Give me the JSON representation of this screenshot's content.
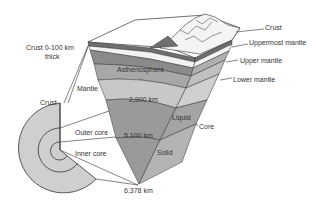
{
  "diagram": {
    "title": "",
    "colors": {
      "background": "#ffffff",
      "line": "#333333",
      "crust_dark": "#6e6e6e",
      "uppermost_mantle": "#f2f2f2",
      "asthenosphere": "#8a8a8a",
      "upper_mantle": "#a8a8a8",
      "lower_mantle": "#c8c8c8",
      "outer_core": "#9a9a9a",
      "inner_core": "#b4b4b4",
      "cross_section": "#cfcfcf",
      "mountain": "#f4f4f4"
    },
    "right_labels": {
      "crust": "Crust",
      "uppermost_mantle": "Uppermost mantle",
      "upper_mantle": "Upper mantle",
      "lower_mantle": "Lower mantle",
      "core": "Core"
    },
    "left_labels": {
      "crust_thickness_line1": "Crust 0-100 km",
      "crust_thickness_line2": "thick",
      "crust": "Crust",
      "mantle": "Mantle",
      "outer_core": "Outer core",
      "inner_core": "Inner core"
    },
    "wedge_labels": {
      "asthenosphere": "Asthenosphere",
      "depth_mantle_core": "2,900 km",
      "liquid": "Liquid",
      "depth_outer_inner": "5,100 km",
      "solid": "Solid",
      "depth_center": "6,378 km"
    }
  }
}
